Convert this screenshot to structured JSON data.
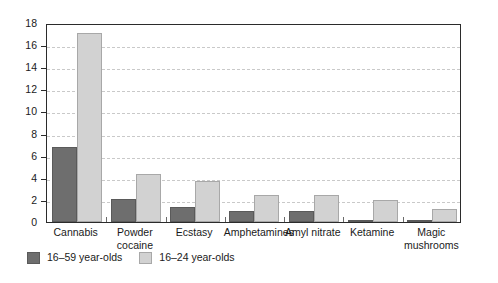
{
  "chart_data": {
    "type": "bar",
    "title": "",
    "subtitle": "",
    "xlabel": "",
    "ylabel": "",
    "ylim": [
      0,
      18
    ],
    "ytick_step": 2,
    "yticks": [
      18,
      16,
      14,
      12,
      10,
      8,
      6,
      4,
      2,
      0
    ],
    "grid": true,
    "grid_axis": "y",
    "grid_style": "dashed",
    "legend_position": "bottom-left",
    "categories": [
      "Cannabis",
      "Powder cocaine",
      "Ecstasy",
      "Amphetamines",
      "Amyl nitrate",
      "Ketamine",
      "Magic mushrooms"
    ],
    "series": [
      {
        "name": "16–59 year-olds",
        "color": "#6e6e6e",
        "values": [
          6.8,
          2.1,
          1.4,
          1.0,
          1.0,
          0.2,
          0.1
        ]
      },
      {
        "name": "16–24 year-olds",
        "color": "#d2d2d2",
        "values": [
          17.1,
          4.3,
          3.7,
          2.4,
          2.4,
          2.0,
          1.2
        ]
      }
    ]
  },
  "legend": {
    "items": [
      {
        "label": "16–59 year-olds",
        "series": "a"
      },
      {
        "label": "16–24 year-olds",
        "series": "b"
      }
    ]
  },
  "colors": {
    "series_a": "#6e6e6e",
    "series_b": "#d2d2d2",
    "axis": "#2b2b2b",
    "grid": "#c9c9c9",
    "text": "#1a1a1a",
    "background": "#ffffff"
  }
}
